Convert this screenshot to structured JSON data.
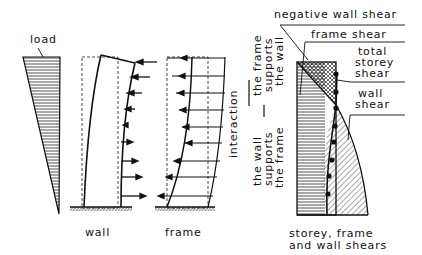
{
  "figure": {
    "panels": [
      {
        "id": "load",
        "label": "load"
      },
      {
        "id": "wall",
        "label": "wall"
      },
      {
        "id": "frame",
        "label": "frame"
      },
      {
        "id": "shears",
        "caption_line1": "storey, frame",
        "caption_line2": "and wall shears"
      }
    ],
    "shear_labels": {
      "negative_wall_shear": "negative wall shear",
      "frame_shear": "frame shear",
      "total_storey_shear_1": "total",
      "total_storey_shear_2": "storey",
      "total_storey_shear_3": "shear",
      "wall_shear_1": "wall",
      "wall_shear_2": "shear"
    },
    "interaction": {
      "title": "interaction",
      "upper_1": "the frame",
      "upper_2": "supports",
      "upper_3": "the wall",
      "lower_1": "the wall",
      "lower_2": "supports",
      "lower_3": "the frame"
    },
    "colors": {
      "ink": "#111111",
      "background": "#ffffff"
    }
  }
}
